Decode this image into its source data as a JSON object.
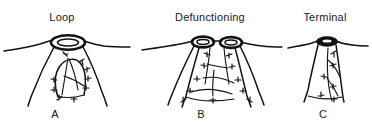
{
  "figure": {
    "background_color": "#ffffff",
    "ink_color": "#121212",
    "kind": "medical-line-illustration",
    "panels": [
      {
        "id": "a",
        "title": "Loop",
        "letter": "A",
        "stoma_count": 1,
        "stoma_style": "double-ring-oval",
        "description": "Loop stoma: single oval opening with inner ring, bowel loop beneath abdominal wall with suture marks"
      },
      {
        "id": "b",
        "title": "Defunctioning",
        "letter": "B",
        "stoma_count": 2,
        "stoma_style": "double-ring-oval-pair",
        "description": "Defunctioning stoma: two adjacent oval openings with separated bowel limbs and suture marks"
      },
      {
        "id": "c",
        "title": "Terminal",
        "letter": "C",
        "stoma_count": 1,
        "stoma_style": "filled-oval",
        "description": "Terminal stoma: single small dark opening with a single bowel limb and suture marks"
      }
    ]
  }
}
